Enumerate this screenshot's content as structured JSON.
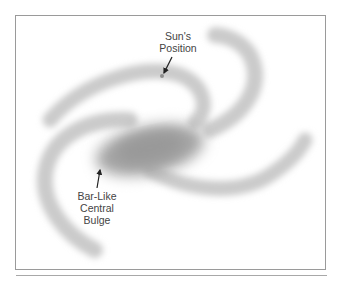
{
  "figure": {
    "labels": {
      "sun": [
        "Sun's",
        "Position"
      ],
      "bulge": [
        "Bar-Like",
        "Central",
        "Bulge"
      ]
    },
    "colors": {
      "arm": "#c9c9c9",
      "bulge": "#9b9b9b",
      "text": "#444444",
      "frame": "#9a9a9a",
      "sun_dot": "#8e8e8e"
    }
  }
}
